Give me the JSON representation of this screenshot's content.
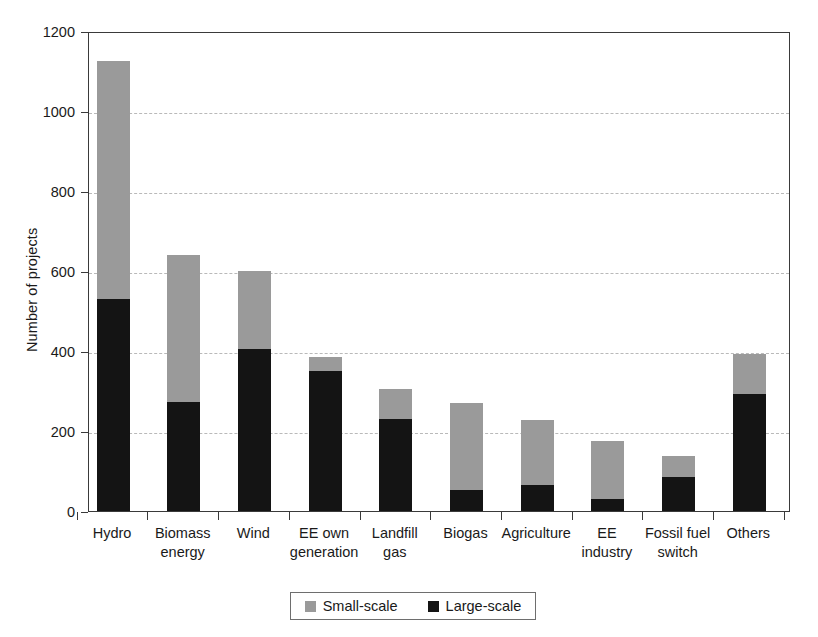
{
  "chart_data": {
    "type": "bar",
    "subtype": "stacked-bar",
    "title": "",
    "xlabel": "",
    "ylabel": "Number of projects",
    "ylim": [
      0,
      1200
    ],
    "yticks": [
      0,
      200,
      400,
      600,
      800,
      1000,
      1200
    ],
    "ytick_labels": [
      "0",
      "200",
      "400",
      "600",
      "800",
      "1000",
      "1200"
    ],
    "grid": "horizontal-dashed",
    "legend_position": "bottom-center",
    "categories": [
      "Hydro",
      "Biomass energy",
      "Wind",
      "EE own generation",
      "Landfill gas",
      "Biogas",
      "Agriculture",
      "EE industry",
      "Fossil fuel switch",
      "Others"
    ],
    "category_lines": [
      [
        "Hydro"
      ],
      [
        "Biomass",
        "energy"
      ],
      [
        "Wind"
      ],
      [
        "EE own",
        "generation"
      ],
      [
        "Landfill",
        "gas"
      ],
      [
        "Biogas"
      ],
      [
        "Agriculture"
      ],
      [
        "EE",
        "industry"
      ],
      [
        "Fossil fuel",
        "switch"
      ],
      [
        "Others"
      ]
    ],
    "series": [
      {
        "name": "Large-scale",
        "color": "#141414",
        "values": [
          530,
          272,
          405,
          350,
          230,
          52,
          65,
          30,
          85,
          292
        ]
      },
      {
        "name": "Small-scale",
        "color": "#9a9a9a",
        "values": [
          595,
          368,
          195,
          35,
          75,
          218,
          163,
          145,
          52,
          100
        ]
      }
    ],
    "totals": [
      1125,
      640,
      600,
      385,
      305,
      270,
      228,
      175,
      137,
      392
    ]
  },
  "legend": {
    "entries": [
      {
        "label": "Small-scale",
        "color": "#9a9a9a"
      },
      {
        "label": "Large-scale",
        "color": "#141414"
      }
    ]
  }
}
